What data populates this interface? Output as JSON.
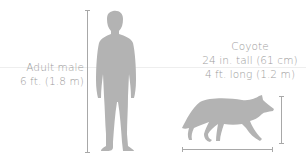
{
  "figure": {
    "type": "size-comparison",
    "colors": {
      "silhouette": "#b3b3b3",
      "text": "#9c9c9c",
      "measure_lines": "#a8a8a8",
      "guide_line": "#eeeeee"
    },
    "human": {
      "label": "Adult male",
      "height": "6 ft. (1.8 m)",
      "icon": "man-silhouette-icon"
    },
    "coyote": {
      "label": "Coyote",
      "height": "24 in. tall (61 cm)",
      "length": "4 ft. long (1.2 m)",
      "icon": "coyote-silhouette-icon"
    }
  }
}
